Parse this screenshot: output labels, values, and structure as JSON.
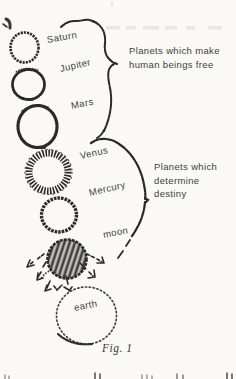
{
  "figure": {
    "caption": "Fig. 1",
    "planets": [
      {
        "name": "Saturn"
      },
      {
        "name": "Jupiter"
      },
      {
        "name": "Mars"
      },
      {
        "name": "Venus"
      },
      {
        "name": "Mercury"
      },
      {
        "name": "moon"
      },
      {
        "name": "earth"
      }
    ],
    "annotations": {
      "free_group": {
        "line1": "Planets which make",
        "line2": "human beings free"
      },
      "destiny_group": {
        "line1": "Planets which",
        "line2": "determine",
        "line3": "destiny"
      }
    },
    "colors": {
      "ink": "#2d2b28",
      "text": "#403e3b",
      "paper": "#faf9f6"
    }
  }
}
